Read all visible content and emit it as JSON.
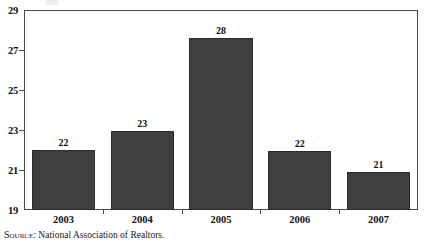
{
  "chart_data": {
    "type": "bar",
    "title": "",
    "subtitle": "",
    "xlabel": "",
    "ylabel": "",
    "categories": [
      "2003",
      "2004",
      "2005",
      "2006",
      "2007"
    ],
    "values": [
      22,
      23,
      28,
      22,
      21
    ],
    "plotted_values": [
      22.0,
      22.95,
      27.6,
      21.95,
      20.9
    ],
    "data_labels": [
      "22",
      "23",
      "28",
      "22",
      "21"
    ],
    "ylim": [
      19,
      29
    ],
    "y_ticks": [
      19,
      21,
      23,
      25,
      27,
      29
    ],
    "y_tick_labels": [
      "19",
      "21",
      "23",
      "25",
      "27",
      "29"
    ],
    "grid": false,
    "legend": false,
    "legend_position": "none",
    "bar_color": "#3f3f3f",
    "bar_edge_color": "#2a2a2a",
    "axis_color": "#4a4a4a",
    "background_color": "#ffffff"
  },
  "source": {
    "prefix": "Source",
    "separator": ":",
    "text": "National Association of Realtors.",
    "full": "Source: National Association of Realtors."
  }
}
